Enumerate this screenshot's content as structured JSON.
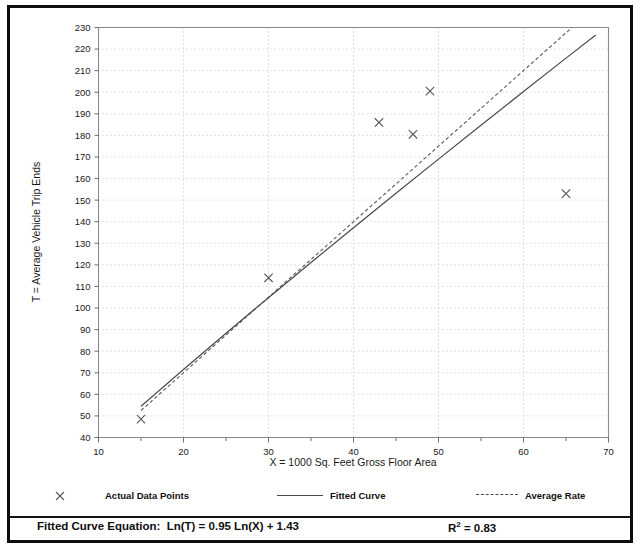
{
  "chart_data": {
    "type": "scatter",
    "title": "",
    "xlabel": "X = 1000 Sq. Feet Gross Floor Area",
    "ylabel": "T = Average Vehicle Trip Ends",
    "xlim": [
      10,
      70
    ],
    "ylim": [
      40,
      230
    ],
    "xticks": [
      10,
      20,
      30,
      40,
      50,
      60,
      70
    ],
    "yticks": [
      40,
      50,
      60,
      70,
      80,
      90,
      100,
      110,
      120,
      130,
      140,
      150,
      160,
      170,
      180,
      190,
      200,
      210,
      220,
      230
    ],
    "xtick_labels": [
      "10",
      "20",
      "30",
      "40",
      "50",
      "60",
      "70"
    ],
    "ytick_labels": [
      "40",
      "50",
      "60",
      "70",
      "80",
      "90",
      "100",
      "110",
      "120",
      "130",
      "140",
      "150",
      "160",
      "170",
      "180",
      "190",
      "200",
      "210",
      "220",
      "230"
    ],
    "x_minor_step": 5,
    "grid": true,
    "grid_style": "dotted",
    "legend_position": "below-plot",
    "series": [
      {
        "name": "Actual Data Points",
        "type": "scatter",
        "marker": "x",
        "points": [
          {
            "x": 15,
            "y": 48.5
          },
          {
            "x": 30,
            "y": 114
          },
          {
            "x": 43,
            "y": 186
          },
          {
            "x": 47,
            "y": 180.5
          },
          {
            "x": 49,
            "y": 200.5
          },
          {
            "x": 65,
            "y": 153
          }
        ]
      },
      {
        "name": "Fitted Curve",
        "type": "line",
        "style": "solid",
        "equation": "Ln(T) = 0.95 Ln(X) + 1.43",
        "points": [
          {
            "x": 15,
            "y": 54.5
          },
          {
            "x": 20,
            "y": 71.5
          },
          {
            "x": 25,
            "y": 88.3
          },
          {
            "x": 30,
            "y": 104.8
          },
          {
            "x": 35,
            "y": 121.1
          },
          {
            "x": 40,
            "y": 137.2
          },
          {
            "x": 45,
            "y": 153.2
          },
          {
            "x": 50,
            "y": 169.0
          },
          {
            "x": 55,
            "y": 184.7
          },
          {
            "x": 60,
            "y": 200.3
          },
          {
            "x": 65,
            "y": 215.8
          },
          {
            "x": 68.5,
            "y": 226.5
          }
        ]
      },
      {
        "name": "Average Rate",
        "type": "line",
        "style": "dashed",
        "points": [
          {
            "x": 15,
            "y": 52.5
          },
          {
            "x": 30,
            "y": 105.0
          },
          {
            "x": 40,
            "y": 140.0
          },
          {
            "x": 50,
            "y": 175.0
          },
          {
            "x": 62.5,
            "y": 218.8
          },
          {
            "x": 65.7,
            "y": 230.0
          }
        ]
      }
    ]
  },
  "legend": {
    "items": [
      {
        "label": "Actual Data Points",
        "marker": "x-marker-icon"
      },
      {
        "label": "Fitted Curve",
        "marker": "solid-line-icon"
      },
      {
        "label": "Average Rate",
        "marker": "dashed-line-icon"
      }
    ]
  },
  "footer": {
    "equation_text": "Fitted Curve Equation:  Ln(T) = 0.95 Ln(X) + 1.43",
    "r2_prefix": "R",
    "r2_sup": "2",
    "r2_value": " = 0.83"
  },
  "colors": {
    "frame": "#0d0d0d",
    "axis": "#8a8a8a",
    "grid": "#c9c9c9",
    "line": "#4a4a4a",
    "marker": "#5a5a5a",
    "text": "#111111"
  }
}
